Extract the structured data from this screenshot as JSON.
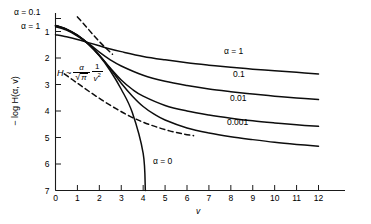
{
  "chart_data": {
    "type": "line",
    "title": "",
    "xlabel": "v",
    "ylabel": "− log H(α, v)",
    "xlim": [
      0,
      12
    ],
    "ylim_display_top": 1,
    "ylim_display_bottom": 7,
    "y_inverted": true,
    "grid": false,
    "x_ticks": [
      "0",
      "1",
      "2",
      "3",
      "4",
      "5",
      "6",
      "7",
      "8",
      "9",
      "10",
      "11",
      "12"
    ],
    "y_ticks": [
      "1",
      "2",
      "3",
      "4",
      "5",
      "6",
      "7"
    ],
    "axis_corner_labels": [
      {
        "text": "α = 0.1",
        "value": "0.1"
      },
      {
        "text": "α = 1",
        "value": "1"
      }
    ],
    "annotation_formula": {
      "lead": "H ~",
      "numerator": "α",
      "denominator_sqrt": "π",
      "second_numerator": "1",
      "second_denominator": "v",
      "second_denominator_exp": "2",
      "full_text": "H ~ α/√π · 1/v²"
    },
    "annotation_alpha_zero": "α = 0",
    "series": [
      {
        "name": "α = 1",
        "label": "α = 1",
        "label_x": 7.6,
        "label_y": 1.62,
        "linestyle": "solid",
        "x": [
          0,
          0.5,
          1,
          1.5,
          2,
          2.5,
          3,
          4,
          5,
          6,
          7,
          8,
          9,
          10,
          11,
          12
        ],
        "y": [
          1.12,
          1.2,
          1.3,
          1.42,
          1.54,
          1.66,
          1.76,
          1.94,
          2.07,
          2.18,
          2.27,
          2.35,
          2.42,
          2.48,
          2.54,
          2.6
        ]
      },
      {
        "name": "α = 0.1",
        "label": "0.1",
        "label_x": 7.9,
        "label_y": 2.52,
        "linestyle": "solid",
        "x": [
          0,
          0.5,
          1,
          1.5,
          2,
          2.5,
          3,
          4,
          5,
          6,
          7,
          8,
          9,
          10,
          11,
          12
        ],
        "y": [
          0.82,
          0.95,
          1.17,
          1.45,
          1.78,
          2.07,
          2.3,
          2.65,
          2.88,
          3.04,
          3.17,
          3.27,
          3.36,
          3.44,
          3.51,
          3.57
        ]
      },
      {
        "name": "α = 0.01",
        "label": "0.01",
        "label_x": 7.85,
        "label_y": 3.48,
        "linestyle": "solid",
        "x": [
          0,
          0.5,
          1,
          1.5,
          2,
          2.5,
          3,
          3.5,
          4,
          5,
          6,
          7,
          8,
          9,
          10,
          11,
          12
        ],
        "y": [
          0.78,
          0.92,
          1.15,
          1.48,
          1.9,
          2.38,
          2.83,
          3.18,
          3.44,
          3.79,
          4.0,
          4.15,
          4.27,
          4.37,
          4.45,
          4.52,
          4.58
        ]
      },
      {
        "name": "α = 0.001",
        "label": "0.001",
        "label_x": 7.8,
        "label_y": 4.42,
        "linestyle": "solid",
        "x": [
          0,
          0.5,
          1,
          1.5,
          2,
          2.5,
          3,
          3.5,
          4,
          4.5,
          5,
          6,
          7,
          8,
          9,
          10,
          11,
          12
        ],
        "y": [
          0.77,
          0.91,
          1.14,
          1.47,
          1.9,
          2.41,
          2.95,
          3.43,
          3.83,
          4.12,
          4.34,
          4.64,
          4.83,
          4.97,
          5.08,
          5.18,
          5.26,
          5.33
        ]
      },
      {
        "name": "α = 0",
        "label": "α = 0",
        "label_x": 4.55,
        "label_y": 5.35,
        "linestyle": "solid",
        "x": [
          0,
          0.5,
          1,
          1.5,
          2,
          2.5,
          3,
          3.5,
          4,
          4.1
        ],
        "y": [
          0.77,
          0.91,
          1.14,
          1.48,
          1.92,
          2.48,
          3.18,
          4.05,
          5.6,
          7.0
        ]
      },
      {
        "name": "asymptote-upper-dashed",
        "label": "",
        "linestyle": "dashed",
        "x": [
          1.0,
          1.4,
          1.8,
          2.2,
          2.6
        ],
        "y": [
          0.45,
          0.82,
          1.2,
          1.55,
          1.86
        ]
      },
      {
        "name": "asymptote-lower-dashed",
        "label": "",
        "linestyle": "dashed",
        "x": [
          0.4,
          1.0,
          1.6,
          2.2,
          2.8,
          3.4,
          4.0,
          4.6,
          5.2,
          5.8,
          6.3
        ],
        "y": [
          2.6,
          2.95,
          3.3,
          3.63,
          3.93,
          4.2,
          4.42,
          4.6,
          4.75,
          4.86,
          4.93
        ]
      }
    ]
  },
  "labels": {
    "alpha_0_1_corner": "α = 0.1",
    "alpha_1_corner": "α = 1",
    "series_1": "α = 1",
    "series_0_1": "0.1",
    "series_0_01": "0.01",
    "series_0_001": "0.001",
    "alpha_zero": "α = 0",
    "xaxis": "v",
    "yaxis": "− log H(α, v)"
  },
  "formula": {
    "lead": "H ~",
    "alpha": "α",
    "sqrt_sym": "√",
    "pi": "π",
    "one": "1",
    "v": "v",
    "exp2": "2"
  },
  "xticks": [
    "0",
    "1",
    "2",
    "3",
    "4",
    "5",
    "6",
    "7",
    "8",
    "9",
    "10",
    "11",
    "12"
  ],
  "yticks": [
    "1",
    "2",
    "3",
    "4",
    "5",
    "6",
    "7"
  ]
}
